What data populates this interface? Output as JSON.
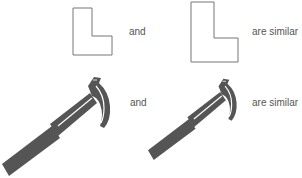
{
  "colors": {
    "outline": "#777777",
    "hammer_fill": "#555555",
    "hammer_shine": "#ffffff",
    "text": "#555555",
    "background": "#ffffff"
  },
  "rows": [
    {
      "name": "l-shapes",
      "first_shape": "small-l-shape",
      "connector": "and",
      "second_shape": "large-l-shape",
      "conclusion": "are similar"
    },
    {
      "name": "hammers",
      "first_shape": "large-hammer",
      "connector": "and",
      "second_shape": "small-hammer",
      "conclusion": "are similar"
    }
  ]
}
